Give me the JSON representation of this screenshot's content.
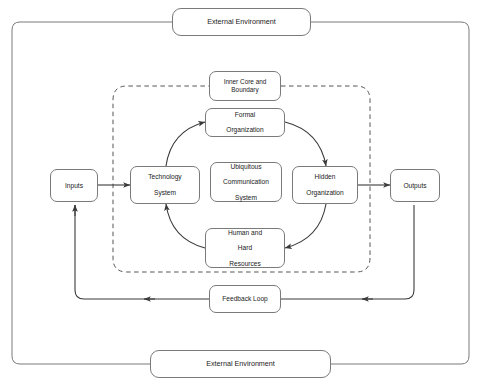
{
  "diagram": {
    "stroke_color": "#7a7a7a",
    "arrow_color": "#3a3a3a",
    "background": "#ffffff"
  },
  "outer_frame": {
    "name": "external-environment-frame",
    "top_label": "External Environment",
    "bottom_label": "External Environment"
  },
  "boundary": {
    "name": "inner-core-boundary",
    "style": "dashed",
    "label": "Inner Core and Boundary"
  },
  "cycle": {
    "name": "ubiquitous-communication-cycle",
    "arrow_style": "bidirectional",
    "nodes": [
      {
        "id": "formal-organization",
        "label_lines": [
          "Formal",
          "Organization"
        ]
      },
      {
        "id": "hidden-organization",
        "label_lines": [
          "Hidden",
          "Organization"
        ]
      },
      {
        "id": "human-hard-resources",
        "label_lines": [
          "Human and",
          "Hard",
          "Resources"
        ]
      },
      {
        "id": "technology-system",
        "label_lines": [
          "Technology",
          "System"
        ]
      }
    ],
    "center_node": {
      "id": "ubiquitous-communication-system",
      "label_lines": [
        "Ubiquitous",
        "Communication",
        "System"
      ]
    }
  },
  "flow": {
    "inputs_label": "Inputs",
    "outputs_label": "Outputs",
    "feedback_label": "Feedback Loop",
    "feedback_direction": "right-to-left"
  }
}
